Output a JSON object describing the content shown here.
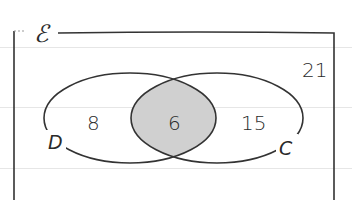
{
  "diagram": {
    "type": "venn",
    "universal_symbol": "ℰ",
    "sets": [
      {
        "name": "D",
        "label": "D"
      },
      {
        "name": "C",
        "label": "C"
      }
    ],
    "regions": {
      "D_only": "8",
      "D_and_C": "6",
      "C_only": "15",
      "neither": "21"
    },
    "colors": {
      "outline": "#333333",
      "intersection_fill": "#d0d0d0",
      "background": "#ffffff",
      "grid_lines": "#e6e6e6"
    }
  }
}
